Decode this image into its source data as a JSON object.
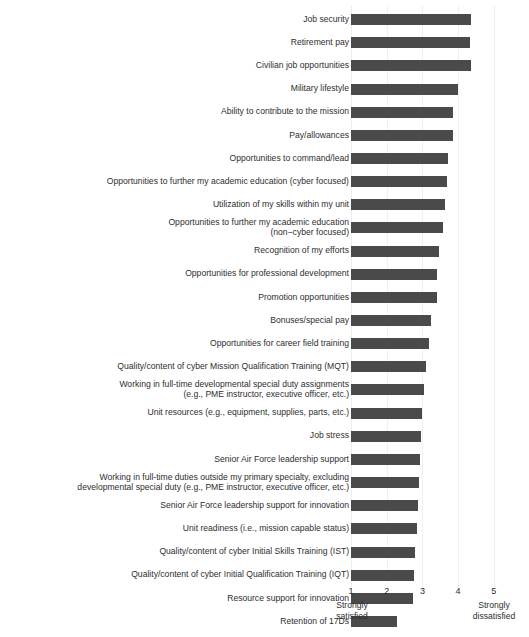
{
  "chart": {
    "title_fragment": "",
    "bar_color": "#4a4a4a",
    "grid_color": "#f0f0f0",
    "text_color": "#2e2e2e"
  },
  "axis": {
    "ticks": [
      "1",
      "2",
      "3",
      "4",
      "5"
    ],
    "left_endcap": "Strongly\nsatisfied",
    "right_endcap": "Strongly\ndissatisfied"
  },
  "chart_data": {
    "type": "bar",
    "orientation": "horizontal",
    "title": "",
    "xlabel": "",
    "ylabel": "",
    "xlim": [
      1,
      5.4
    ],
    "grid": true,
    "legend": "none",
    "xtick_labels": [
      "1",
      "2",
      "3",
      "4",
      "5"
    ],
    "xtick_values": [
      1,
      2,
      3,
      4,
      5
    ],
    "x_axis_anchors": [
      "Strongly satisfied",
      "Strongly dissatisfied"
    ],
    "categories": [
      "Job security",
      "Retirement pay",
      "Civilian job opportunities",
      "Military lifestyle",
      "Ability to contribute to the mission",
      "Pay/allowances",
      "Opportunities to command/lead",
      "Opportunities to further my academic education (cyber focused)",
      "Utilization of my skills within my unit",
      "Opportunities to further my academic education\n(non−cyber focused)",
      "Recognition of my efforts",
      "Opportunities for professional development",
      "Promotion opportunities",
      "Bonuses/special pay",
      "Opportunities for career field training",
      "Quality/content of cyber Mission Qualification Training (MQT)",
      "Working in full-time developmental special duty assignments\n(e.g., PME instructor, executive officer, etc.)",
      "Unit resources (e.g., equipment, supplies, parts, etc.)",
      "Job stress",
      "Senior Air Force leadership support",
      "Working in full-time duties outside my primary specialty, excluding\ndevelopmental special duty (e.g., PME instructor, executive officer, etc.)",
      "Senior Air Force leadership support for innovation",
      "Unit readiness (i.e., mission capable status)",
      "Quality/content of cyber Initial Skills Training (IST)",
      "Quality/content of cyber Initial Qualification Training (IQT)",
      "Resource support for innovation",
      "Retention of 17Ds"
    ],
    "values": [
      4.36,
      4.33,
      4.37,
      4.0,
      3.87,
      3.87,
      3.72,
      3.68,
      3.64,
      3.58,
      3.46,
      3.42,
      3.41,
      3.24,
      3.18,
      3.09,
      3.04,
      3.0,
      2.96,
      2.93,
      2.9,
      2.88,
      2.86,
      2.79,
      2.76,
      2.74,
      2.3
    ]
  }
}
